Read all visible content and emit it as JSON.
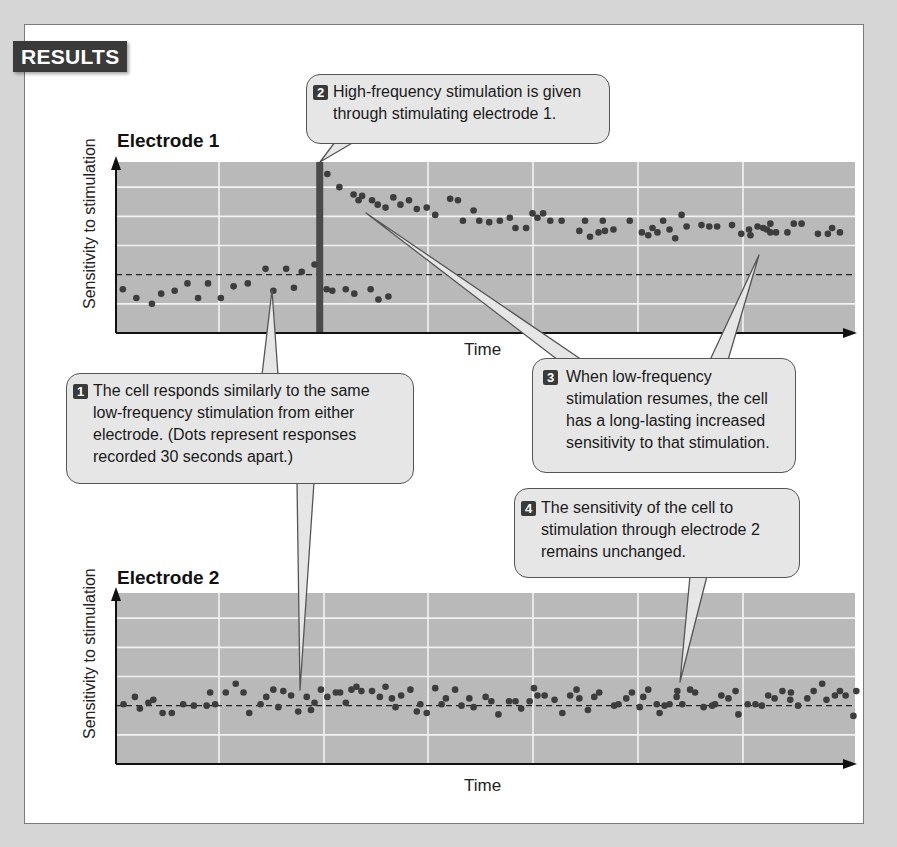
{
  "badge": "RESULTS",
  "colors": {
    "plot_bg": "#b9b9b9",
    "grid": "#f2f2f2",
    "dot": "#3d3d3d",
    "stim_bar": "#4a4a4a",
    "callout_bg": "#e6e6e6",
    "badge_bg": "#3a3a3a"
  },
  "callouts": [
    {
      "number": "1",
      "lines": [
        "The cell responds similarly to the same",
        "low-frequency stimulation from either",
        "electrode. (Dots represent responses",
        "recorded 30 seconds apart.)"
      ]
    },
    {
      "number": "2",
      "lines": [
        "High-frequency stimulation is given",
        "through stimulating electrode 1."
      ]
    },
    {
      "number": "3",
      "lines": [
        "When low-frequency",
        "stimulation resumes, the cell",
        "has a long-lasting increased",
        "sensitivity to that stimulation."
      ]
    },
    {
      "number": "4",
      "lines": [
        "The sensitivity of the cell to",
        "stimulation through electrode 2",
        "remains unchanged."
      ]
    }
  ],
  "chart_data": [
    {
      "type": "scatter",
      "title": "Electrode 1",
      "xlabel": "Time",
      "ylabel": "Sensitivity to stimulation",
      "xlim": [
        0,
        100
      ],
      "ylim": [
        -2,
        4
      ],
      "grid": true,
      "baseline": 0,
      "event": {
        "label": "High-frequency stimulation",
        "x": 28.2
      },
      "series": [
        {
          "name": "before stimulation",
          "points": [
            [
              0.4,
              -0.5
            ],
            [
              2.3,
              -0.8
            ],
            [
              4.5,
              -1.0
            ],
            [
              5.8,
              -0.65
            ],
            [
              7.7,
              -0.55
            ],
            [
              9.5,
              -0.3
            ],
            [
              11,
              -0.8
            ],
            [
              12.4,
              -0.3
            ],
            [
              14.2,
              -0.8
            ],
            [
              16,
              -0.4
            ],
            [
              18,
              -0.3
            ],
            [
              20.5,
              0.2
            ],
            [
              21.6,
              -0.55
            ],
            [
              23.4,
              0.2
            ],
            [
              24.5,
              -0.45
            ],
            [
              25.6,
              0.1
            ],
            [
              27.4,
              0.35
            ],
            [
              29.1,
              -0.5
            ],
            [
              29.9,
              -0.55
            ],
            [
              31.8,
              -0.5
            ],
            [
              33,
              -0.65
            ],
            [
              35.3,
              -0.5
            ],
            [
              36.4,
              -0.85
            ],
            [
              37.8,
              -0.75
            ]
          ]
        },
        {
          "name": "after stimulation",
          "points": [
            [
              29.2,
              3.45
            ],
            [
              30.9,
              3.0
            ],
            [
              32.9,
              2.75
            ],
            [
              33.6,
              2.55
            ],
            [
              34.1,
              2.7
            ],
            [
              35.5,
              2.55
            ],
            [
              36.3,
              2.4
            ],
            [
              37.4,
              2.3
            ],
            [
              38.5,
              2.65
            ],
            [
              39.5,
              2.4
            ],
            [
              40.7,
              2.55
            ],
            [
              41.8,
              2.25
            ],
            [
              43.2,
              2.3
            ],
            [
              44.4,
              2.05
            ],
            [
              46.5,
              2.6
            ],
            [
              47.6,
              2.55
            ],
            [
              48.3,
              1.85
            ],
            [
              49.8,
              2.2
            ],
            [
              50.6,
              1.85
            ],
            [
              52,
              1.8
            ],
            [
              53.5,
              1.85
            ],
            [
              54.9,
              1.95
            ],
            [
              55.7,
              1.6
            ],
            [
              57.2,
              1.6
            ],
            [
              58.1,
              2.1
            ],
            [
              58.8,
              1.95
            ],
            [
              59.6,
              2.1
            ],
            [
              60.6,
              1.85
            ],
            [
              62.2,
              1.85
            ],
            [
              64.7,
              1.5
            ],
            [
              65.5,
              1.85
            ],
            [
              66.2,
              1.3
            ],
            [
              67.4,
              1.45
            ],
            [
              68,
              1.85
            ],
            [
              68.3,
              1.5
            ],
            [
              69.5,
              1.55
            ],
            [
              71.8,
              1.85
            ],
            [
              73.5,
              1.45
            ],
            [
              74.4,
              1.35
            ],
            [
              75,
              1.6
            ],
            [
              75.7,
              1.45
            ],
            [
              76.5,
              1.85
            ],
            [
              77.4,
              1.55
            ],
            [
              78.2,
              1.25
            ],
            [
              79.1,
              2.05
            ],
            [
              79.8,
              1.65
            ],
            [
              81.9,
              1.7
            ],
            [
              83,
              1.65
            ],
            [
              84.1,
              1.65
            ],
            [
              86.2,
              1.7
            ],
            [
              87.5,
              1.4
            ],
            [
              88.6,
              1.55
            ],
            [
              88.8,
              1.35
            ],
            [
              89.8,
              1.65
            ],
            [
              90.6,
              1.6
            ],
            [
              91.1,
              1.55
            ],
            [
              91.6,
              1.45
            ],
            [
              91.6,
              1.75
            ],
            [
              92.4,
              1.45
            ],
            [
              94,
              1.45
            ],
            [
              94.9,
              1.75
            ],
            [
              96,
              1.75
            ],
            [
              98.3,
              1.4
            ],
            [
              99.7,
              1.4
            ],
            [
              100.3,
              1.6
            ],
            [
              101.4,
              1.45
            ]
          ]
        }
      ]
    },
    {
      "type": "scatter",
      "title": "Electrode 2",
      "xlabel": "Time",
      "ylabel": "Sensitivity to stimulation",
      "xlim": [
        0,
        100
      ],
      "ylim": [
        -2,
        4
      ],
      "grid": true,
      "baseline": 0,
      "series": [
        {
          "name": "responses",
          "points": [
            [
              0.5,
              0.05
            ],
            [
              2.1,
              0.3
            ],
            [
              2.8,
              -0.1
            ],
            [
              4,
              0.1
            ],
            [
              4.7,
              0.2
            ],
            [
              6,
              -0.25
            ],
            [
              7.3,
              -0.25
            ],
            [
              8.9,
              0.05
            ],
            [
              10.4,
              0.0
            ],
            [
              12.2,
              0.0
            ],
            [
              12.7,
              0.45
            ],
            [
              13.4,
              0.05
            ],
            [
              14.9,
              0.45
            ],
            [
              16.3,
              0.75
            ],
            [
              17.4,
              0.45
            ],
            [
              18.2,
              -0.25
            ],
            [
              19.8,
              0.05
            ],
            [
              20.6,
              0.3
            ],
            [
              21.6,
              0.55
            ],
            [
              22.3,
              -0.05
            ],
            [
              23,
              0.5
            ],
            [
              24.1,
              0.35
            ],
            [
              25.1,
              -0.2
            ],
            [
              26.3,
              0.3
            ],
            [
              26.9,
              -0.15
            ],
            [
              27.4,
              0.1
            ],
            [
              28.3,
              0.55
            ],
            [
              29.2,
              0.3
            ],
            [
              30.4,
              0.45
            ],
            [
              31,
              0.45
            ],
            [
              31.8,
              0.1
            ],
            [
              32.6,
              0.55
            ],
            [
              33.3,
              0.65
            ],
            [
              34,
              0.5
            ],
            [
              35.5,
              0.5
            ],
            [
              36.6,
              0.3
            ],
            [
              37.4,
              0.65
            ],
            [
              38.3,
              0.25
            ],
            [
              38.8,
              -0.05
            ],
            [
              39.6,
              0.35
            ],
            [
              40.9,
              0.55
            ],
            [
              41.8,
              -0.2
            ],
            [
              42.3,
              0.05
            ],
            [
              43.2,
              -0.25
            ],
            [
              44.4,
              0.6
            ],
            [
              45.3,
              0.05
            ],
            [
              45.9,
              0.25
            ],
            [
              47.2,
              0.55
            ],
            [
              48.1,
              0.0
            ],
            [
              49.2,
              0.25
            ],
            [
              49.8,
              -0.05
            ],
            [
              51.5,
              0.3
            ],
            [
              52.3,
              0.15
            ],
            [
              53.3,
              -0.3
            ],
            [
              54.8,
              0.15
            ],
            [
              55.7,
              0.15
            ],
            [
              56.5,
              -0.1
            ],
            [
              57.7,
              0.15
            ],
            [
              58.3,
              0.6
            ],
            [
              58.8,
              0.35
            ],
            [
              59.8,
              0.35
            ],
            [
              61.2,
              0.2
            ],
            [
              62.3,
              -0.25
            ],
            [
              63.4,
              0.35
            ],
            [
              64.3,
              0.55
            ],
            [
              64.7,
              0.25
            ],
            [
              65.9,
              -0.15
            ],
            [
              66.8,
              0.3
            ],
            [
              67.5,
              0.45
            ],
            [
              69.6,
              0.0
            ],
            [
              70.2,
              0.05
            ],
            [
              71.3,
              0.25
            ],
            [
              72.1,
              0.45
            ],
            [
              73.2,
              -0.05
            ],
            [
              73.7,
              0.3
            ],
            [
              74.4,
              0.55
            ],
            [
              75.6,
              0.05
            ],
            [
              76,
              -0.25
            ],
            [
              76.7,
              0.0
            ],
            [
              77.4,
              0.05
            ],
            [
              78.4,
              0.3
            ],
            [
              78.5,
              0.5
            ],
            [
              79.2,
              0.05
            ],
            [
              80.3,
              0.55
            ],
            [
              81,
              0.45
            ],
            [
              82.2,
              -0.05
            ],
            [
              83.4,
              0.0
            ],
            [
              83.8,
              0.05
            ],
            [
              84.7,
              0.35
            ],
            [
              85.7,
              0.25
            ],
            [
              86.7,
              0.5
            ],
            [
              87.1,
              -0.3
            ],
            [
              88.4,
              0.05
            ],
            [
              89.5,
              0.05
            ],
            [
              90.4,
              0.0
            ],
            [
              91.3,
              0.35
            ],
            [
              92.2,
              0.25
            ],
            [
              93.3,
              0.5
            ],
            [
              94.4,
              0.2
            ],
            [
              94.5,
              0.45
            ],
            [
              95.5,
              0.0
            ],
            [
              96.8,
              0.25
            ],
            [
              97.7,
              0.5
            ],
            [
              98.9,
              0.75
            ],
            [
              99.5,
              0.2
            ],
            [
              100.7,
              0.35
            ],
            [
              101.4,
              0.5
            ],
            [
              102.2,
              0.35
            ],
            [
              103.3,
              -0.35
            ],
            [
              103.7,
              0.5
            ]
          ]
        }
      ]
    }
  ]
}
